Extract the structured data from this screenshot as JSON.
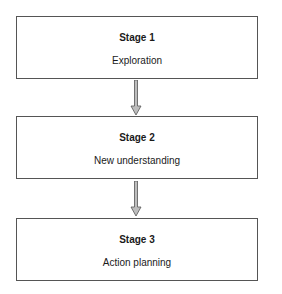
{
  "diagram": {
    "stages": [
      {
        "title": "Stage 1",
        "label": "Exploration"
      },
      {
        "title": "Stage 2",
        "label": "New understanding"
      },
      {
        "title": "Stage 3",
        "label": "Action planning"
      }
    ],
    "colors": {
      "border": "#555555",
      "arrow_fill": "#bdbdbd",
      "arrow_stroke": "#555555"
    }
  }
}
